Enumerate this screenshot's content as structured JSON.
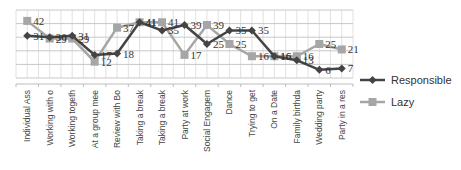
{
  "chart_data": {
    "type": "line",
    "title": "",
    "xlabel": "",
    "ylabel": "",
    "ylim": [
      0,
      50
    ],
    "grid": true,
    "legend_position": "right",
    "categories": [
      "Individual Assignment",
      "Working with one other",
      "Working together on",
      "At a group meeting",
      "Review with Boss",
      "Taking a break with",
      "Taking a break by",
      "Party at work",
      "Social Engagement",
      "Dance",
      "Trying to get a date",
      "On a Date",
      "Family birthday party",
      "Wedding party at a",
      "Party in a restaurant"
    ],
    "series": [
      {
        "name": "Responsible",
        "color": "#444444",
        "marker": "diamond",
        "values": [
          31,
          30,
          31,
          17,
          18,
          41,
          35,
          39,
          25,
          35,
          35,
          16,
          13,
          6,
          7
        ]
      },
      {
        "name": "Lazy",
        "color": "#a6a6a6",
        "marker": "square",
        "values": [
          42,
          29,
          29,
          12,
          37,
          41,
          41,
          17,
          39,
          25,
          16,
          16,
          16,
          25,
          21
        ]
      }
    ]
  },
  "legend": {
    "items": [
      {
        "label": "Responsible"
      },
      {
        "label": "Lazy"
      }
    ]
  }
}
